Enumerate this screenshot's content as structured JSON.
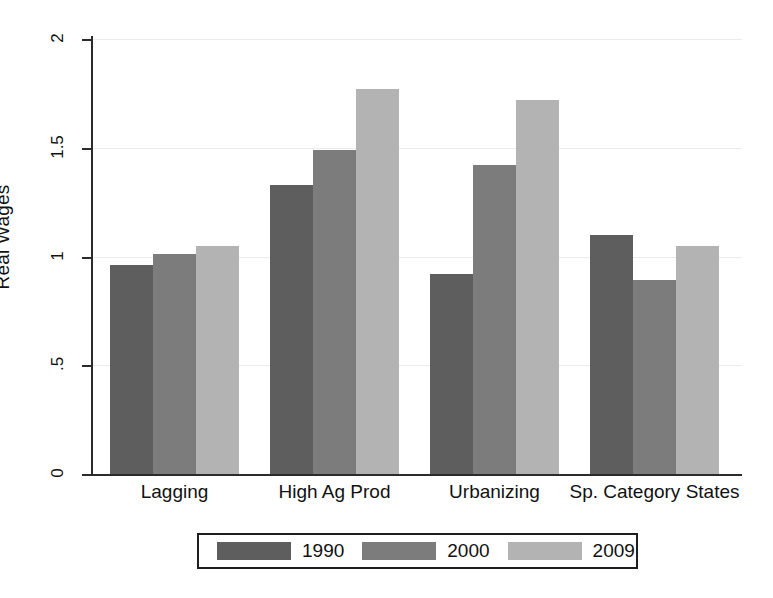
{
  "chart_data": {
    "type": "bar",
    "title": "",
    "subtitle": "",
    "xlabel": "",
    "ylabel": "Real Wages",
    "ylim": [
      0,
      2
    ],
    "yticks": [
      "0",
      ".5",
      "1",
      "1.5",
      "2"
    ],
    "ytick_values": [
      0,
      0.5,
      1,
      1.5,
      2
    ],
    "grid": true,
    "grid_axis": "y",
    "legend_position": "bottom",
    "categories": [
      "Lagging",
      "High Ag Prod",
      "Urbanizing",
      "Sp. Category States"
    ],
    "series": [
      {
        "name": "1990",
        "color": "#5e5e5e",
        "values": [
          0.96,
          1.33,
          0.92,
          1.1
        ]
      },
      {
        "name": "2000",
        "color": "#7c7c7c",
        "values": [
          1.01,
          1.49,
          1.42,
          0.89
        ]
      },
      {
        "name": "2009",
        "color": "#b3b3b3",
        "values": [
          1.05,
          1.77,
          1.72,
          1.05
        ]
      }
    ]
  },
  "axis": {
    "y_title": "Real Wages"
  },
  "legend": {
    "items": [
      {
        "label": "1990"
      },
      {
        "label": "2000"
      },
      {
        "label": "2009"
      }
    ]
  }
}
